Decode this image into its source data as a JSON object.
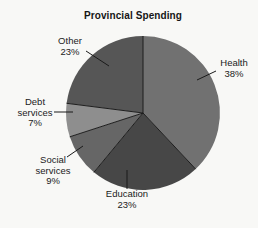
{
  "figure": {
    "background_color": "#f8f8f6",
    "text_color": "#1b1b1b",
    "line_color": "#1d1d1d"
  },
  "chart_data": {
    "type": "pie",
    "title": "Provincial Spending",
    "direction": "clockwise",
    "start_angle_deg": 0,
    "legend": "none",
    "categories": [
      "Health",
      "Education",
      "Social services",
      "Debt services",
      "Other"
    ],
    "values": [
      38,
      23,
      9,
      7,
      23
    ],
    "slices": [
      {
        "label": "Health",
        "value": 38,
        "pct_label": "38%",
        "color": "#717171"
      },
      {
        "label": "Education",
        "value": 23,
        "pct_label": "23%",
        "color": "#474747"
      },
      {
        "label": "Social services",
        "value": 9,
        "pct_label": "9%",
        "color": "#666666"
      },
      {
        "label": "Debt services",
        "value": 7,
        "pct_label": "7%",
        "color": "#8e8e8e"
      },
      {
        "label": "Other",
        "value": 23,
        "pct_label": "23%",
        "color": "#565656"
      }
    ]
  }
}
